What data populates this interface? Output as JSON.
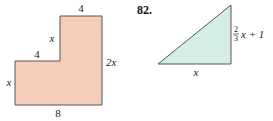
{
  "figures": [
    {
      "id": "l-shape",
      "shape": "L-shaped polygon",
      "fill": "#f6cdb8",
      "stroke": "#555555",
      "labels": {
        "top": "4",
        "upper_left_side": "x",
        "step": "4",
        "lower_left_side": "x",
        "right": "2x",
        "bottom": "8"
      }
    },
    {
      "id": "right-triangle",
      "problem_number": "82.",
      "shape": "right triangle",
      "fill": "#d4eee3",
      "stroke": "#555555",
      "labels": {
        "base": "x",
        "height_frac_num": "2",
        "height_frac_den": "3",
        "height_rest": "x + 1"
      }
    }
  ]
}
